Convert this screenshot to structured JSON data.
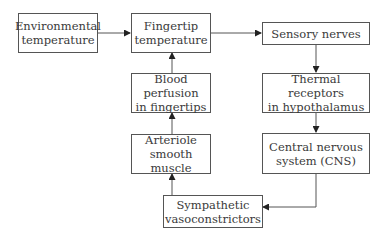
{
  "diagram": {
    "type": "flowchart",
    "nodes": [
      {
        "id": "env_temp",
        "lines": [
          "Environmental",
          "temperature"
        ]
      },
      {
        "id": "finger_temp",
        "lines": [
          "Fingertip",
          "temperature"
        ]
      },
      {
        "id": "sensory",
        "lines": [
          "Sensory nerves"
        ]
      },
      {
        "id": "thermal",
        "lines": [
          "Thermal receptors",
          "in hypothalamus"
        ]
      },
      {
        "id": "cns",
        "lines": [
          "Central nervous",
          "system (CNS)"
        ]
      },
      {
        "id": "sympathetic",
        "lines": [
          "Sympathetic",
          "vasoconstrictors"
        ]
      },
      {
        "id": "arteriole",
        "lines": [
          "Arteriole",
          "smooth muscle"
        ]
      },
      {
        "id": "blood",
        "lines": [
          "Blood perfusion",
          "in fingertips"
        ]
      }
    ],
    "edges": [
      {
        "from": "env_temp",
        "to": "finger_temp"
      },
      {
        "from": "finger_temp",
        "to": "sensory"
      },
      {
        "from": "sensory",
        "to": "thermal"
      },
      {
        "from": "thermal",
        "to": "cns"
      },
      {
        "from": "cns",
        "to": "sympathetic"
      },
      {
        "from": "sympathetic",
        "to": "arteriole"
      },
      {
        "from": "arteriole",
        "to": "blood"
      },
      {
        "from": "blood",
        "to": "finger_temp"
      }
    ],
    "colors": {
      "stroke": "#555555",
      "text": "#3a3a3a",
      "background": "#ffffff"
    }
  }
}
